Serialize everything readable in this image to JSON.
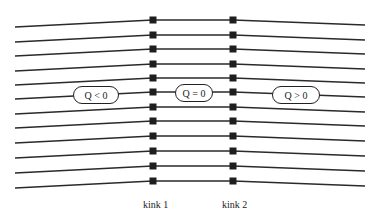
{
  "diagram": {
    "line_count": 12,
    "line_color": "#2a2a2a",
    "marker_color": "#1e1e1e",
    "geometry": {
      "x_left": 15,
      "x_kink1": 153,
      "x_kink2": 233,
      "x_right": 365,
      "left_end_y": [
        27,
        42,
        56,
        71,
        85,
        99,
        114,
        128,
        143,
        158,
        173,
        188
      ],
      "kink_y": [
        20,
        35,
        49,
        64,
        78,
        92,
        107,
        121,
        136,
        151,
        166,
        181
      ],
      "right_end_y": [
        25,
        40,
        54,
        69,
        83,
        97,
        112,
        126,
        141,
        156,
        171,
        186
      ]
    },
    "regions": [
      {
        "label": "Q < 0",
        "left": 73,
        "top": 86,
        "width": 46,
        "height": 18
      },
      {
        "label": "Q = 0",
        "left": 175,
        "top": 84,
        "width": 38,
        "height": 18
      },
      {
        "label": "Q > 0",
        "left": 272,
        "top": 86,
        "width": 48,
        "height": 18
      }
    ],
    "kinks": [
      {
        "label": "kink 1",
        "x": 143,
        "y": 199
      },
      {
        "label": "kink 2",
        "x": 222,
        "y": 199
      }
    ]
  }
}
